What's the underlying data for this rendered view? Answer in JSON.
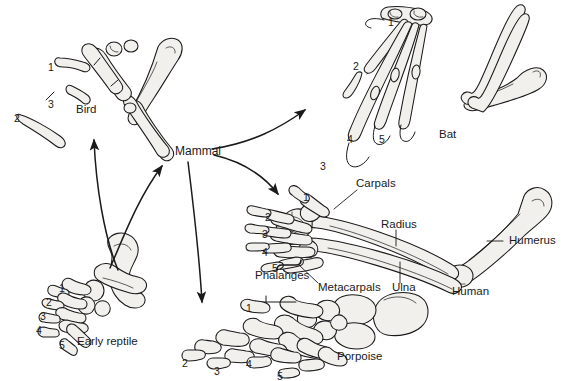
{
  "figure": {
    "kind": "comparative-anatomy-diagram",
    "background_color": "#ffffff",
    "ink_color": "#1a1a1a",
    "bone_fill": "#f2f0ec",
    "width": 564,
    "height": 381
  },
  "nodes": {
    "ancestor": {
      "label": "Early reptile"
    },
    "mammal": {
      "label": "Mammal"
    }
  },
  "taxa": [
    {
      "id": "bird",
      "label": "Bird",
      "x": 76,
      "y": 112
    },
    {
      "id": "bat",
      "label": "Bat",
      "x": 439,
      "y": 137
    },
    {
      "id": "human",
      "label": "Human",
      "x": 452,
      "y": 293
    },
    {
      "id": "porpoise",
      "label": "Porpoise",
      "x": 337,
      "y": 358
    },
    {
      "id": "reptile",
      "label": "Early reptile",
      "x": 77,
      "y": 343
    },
    {
      "id": "mammal",
      "label": "Mammal",
      "x": 175,
      "y": 151
    }
  ],
  "bone_labels": [
    {
      "id": "carpals",
      "label": "Carpals",
      "x": 356,
      "y": 184
    },
    {
      "id": "radius",
      "label": "Radius",
      "x": 381,
      "y": 225
    },
    {
      "id": "humerus",
      "label": "Humerus",
      "x": 509,
      "y": 241
    },
    {
      "id": "ulna",
      "label": "Ulna",
      "x": 392,
      "y": 288
    },
    {
      "id": "metacarpals",
      "label": "Metacarpals",
      "x": 318,
      "y": 288
    },
    {
      "id": "phalanges",
      "label": "Phalanges",
      "x": 284,
      "y": 276
    }
  ],
  "digit_numbers": {
    "bird": [
      {
        "n": "1",
        "x": 48,
        "y": 62
      },
      {
        "n": "2",
        "x": 14,
        "y": 113
      },
      {
        "n": "3",
        "x": 48,
        "y": 99
      }
    ],
    "bat": [
      {
        "n": "1",
        "x": 388,
        "y": 17
      },
      {
        "n": "2",
        "x": 353,
        "y": 61
      },
      {
        "n": "3",
        "x": 320,
        "y": 161
      },
      {
        "n": "4",
        "x": 347,
        "y": 134
      },
      {
        "n": "5",
        "x": 379,
        "y": 134
      }
    ],
    "human": [
      {
        "n": "1",
        "x": 303,
        "y": 192
      },
      {
        "n": "2",
        "x": 265,
        "y": 212
      },
      {
        "n": "3",
        "x": 262,
        "y": 229
      },
      {
        "n": "4",
        "x": 262,
        "y": 247
      },
      {
        "n": "5",
        "x": 272,
        "y": 263
      }
    ],
    "porpoise": [
      {
        "n": "1",
        "x": 246,
        "y": 303
      },
      {
        "n": "2",
        "x": 182,
        "y": 358
      },
      {
        "n": "3",
        "x": 214,
        "y": 366
      },
      {
        "n": "4",
        "x": 246,
        "y": 359
      },
      {
        "n": "5",
        "x": 277,
        "y": 371
      }
    ],
    "reptile": [
      {
        "n": "1",
        "x": 59,
        "y": 283
      },
      {
        "n": "2",
        "x": 46,
        "y": 297
      },
      {
        "n": "3",
        "x": 40,
        "y": 311
      },
      {
        "n": "4",
        "x": 36,
        "y": 325
      },
      {
        "n": "5",
        "x": 59,
        "y": 340
      }
    ]
  },
  "arrows": [
    {
      "id": "reptile-to-mammal",
      "from": "Early reptile",
      "to": "Mammal"
    },
    {
      "id": "reptile-to-bird",
      "from": "Early reptile",
      "to": "Bird"
    },
    {
      "id": "mammal-to-bat",
      "from": "Mammal",
      "to": "Bat"
    },
    {
      "id": "mammal-to-human",
      "from": "Mammal",
      "to": "Human"
    },
    {
      "id": "mammal-to-porpoise",
      "from": "Mammal",
      "to": "Porpoise"
    }
  ]
}
